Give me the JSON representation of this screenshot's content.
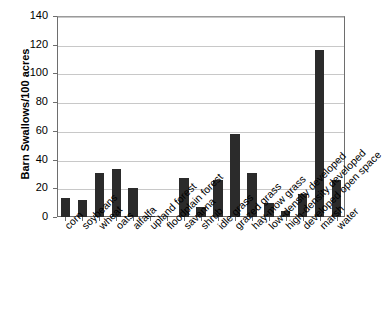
{
  "chart_data": {
    "type": "bar",
    "title": "",
    "xlabel": "",
    "ylabel": "Barn Swallows/100 acres",
    "ylim": [
      0,
      140
    ],
    "ytick_labels": [
      "140",
      "120",
      "100",
      "80",
      "60",
      "40",
      "20",
      "0"
    ],
    "yticks": [
      140,
      120,
      100,
      80,
      60,
      40,
      20,
      0
    ],
    "grid": true,
    "legend": "none",
    "bar_color": "#2b2b2b",
    "categories": [
      "corn",
      "soybeans",
      "wheat",
      "oats",
      "alfalfa",
      "upland forest",
      "floodplain forest",
      "savanna",
      "shrub",
      "idle grass",
      "grazed grass",
      "hay-mow grass",
      "low-density developed",
      "high-density developed",
      "developed open space",
      "marsh",
      "water"
    ],
    "values": [
      13,
      12,
      31,
      33.5,
      20,
      0.8,
      0,
      27.5,
      7,
      25.5,
      58,
      30.5,
      10,
      4,
      16,
      116,
      26
    ]
  }
}
